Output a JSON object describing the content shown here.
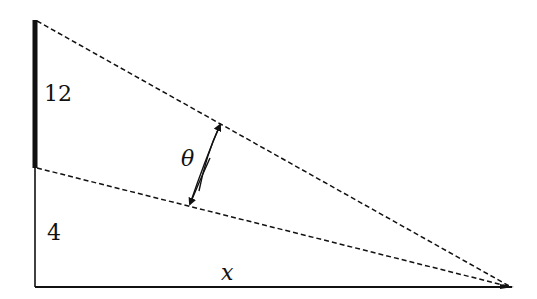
{
  "diagram": {
    "labels": {
      "segment_upper": "12",
      "segment_lower": "4",
      "angle": "θ",
      "base": "x"
    },
    "colors": {
      "stroke": "#111111",
      "background": "#ffffff"
    }
  }
}
